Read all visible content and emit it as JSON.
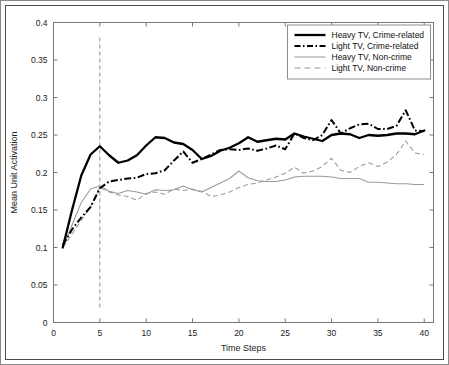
{
  "chart_data": {
    "type": "line",
    "title": "",
    "xlabel": "Time Steps",
    "ylabel": "Mean Unit Activation",
    "xlim": [
      0,
      41
    ],
    "ylim": [
      0,
      0.4
    ],
    "xticks": [
      0,
      5,
      10,
      15,
      20,
      25,
      30,
      35,
      40
    ],
    "xticklabels": [
      "0",
      "5",
      "10",
      "15",
      "20",
      "25",
      "30",
      "35",
      "40"
    ],
    "yticks": [
      0,
      0.05,
      0.1,
      0.15,
      0.2,
      0.25,
      0.3,
      0.35,
      0.4
    ],
    "yticklabels": [
      "0",
      "0.05",
      "0.1",
      "0.15",
      "0.2",
      "0.25",
      "0.3",
      "0.35",
      "0.4"
    ],
    "grid": false,
    "legend_position": "top-right",
    "annotations": [
      {
        "type": "vline",
        "x": 5,
        "y_from": 0.02,
        "y_to": 0.38,
        "style": "dashed",
        "color": "#8e8e8e"
      }
    ],
    "x": [
      1,
      2,
      3,
      4,
      5,
      6,
      7,
      8,
      9,
      10,
      11,
      12,
      13,
      14,
      15,
      16,
      17,
      18,
      19,
      20,
      21,
      22,
      23,
      24,
      25,
      26,
      27,
      28,
      29,
      30,
      31,
      32,
      33,
      34,
      35,
      36,
      37,
      38,
      39,
      40
    ],
    "series": [
      {
        "name": "Heavy TV, Crime-related",
        "color": "#000000",
        "style": "solid",
        "width": "thick",
        "values": [
          0.1,
          0.15,
          0.196,
          0.224,
          0.235,
          0.223,
          0.213,
          0.216,
          0.223,
          0.236,
          0.247,
          0.246,
          0.24,
          0.238,
          0.23,
          0.218,
          0.222,
          0.229,
          0.233,
          0.239,
          0.247,
          0.241,
          0.243,
          0.245,
          0.244,
          0.252,
          0.248,
          0.245,
          0.242,
          0.25,
          0.252,
          0.251,
          0.246,
          0.25,
          0.249,
          0.25,
          0.252,
          0.252,
          0.251,
          0.256
        ]
      },
      {
        "name": "Light TV, Crime-related",
        "color": "#000000",
        "style": "dash-dot",
        "width": "thick",
        "values": [
          0.103,
          0.124,
          0.14,
          0.154,
          0.179,
          0.188,
          0.19,
          0.192,
          0.193,
          0.198,
          0.199,
          0.203,
          0.216,
          0.228,
          0.213,
          0.218,
          0.224,
          0.23,
          0.231,
          0.23,
          0.232,
          0.229,
          0.232,
          0.236,
          0.231,
          0.252,
          0.246,
          0.243,
          0.25,
          0.27,
          0.252,
          0.259,
          0.264,
          0.265,
          0.258,
          0.258,
          0.262,
          0.283,
          0.256,
          0.255
        ]
      },
      {
        "name": "Heavy TV, Non-crime",
        "color": "#9a9a9a",
        "style": "solid",
        "width": "thin",
        "values": [
          0.1,
          0.13,
          0.16,
          0.178,
          0.182,
          0.175,
          0.172,
          0.176,
          0.174,
          0.171,
          0.177,
          0.176,
          0.177,
          0.182,
          0.177,
          0.174,
          0.18,
          0.186,
          0.192,
          0.202,
          0.193,
          0.189,
          0.188,
          0.188,
          0.19,
          0.194,
          0.195,
          0.195,
          0.195,
          0.194,
          0.192,
          0.192,
          0.192,
          0.187,
          0.187,
          0.186,
          0.185,
          0.185,
          0.184,
          0.184
        ]
      },
      {
        "name": "Light TV, Non-crime",
        "color": "#9a9a9a",
        "style": "dashed",
        "width": "thin",
        "values": [
          0.1,
          0.118,
          0.136,
          0.155,
          0.18,
          0.174,
          0.17,
          0.168,
          0.163,
          0.172,
          0.174,
          0.171,
          0.178,
          0.176,
          0.178,
          0.175,
          0.168,
          0.17,
          0.174,
          0.18,
          0.184,
          0.186,
          0.19,
          0.194,
          0.199,
          0.207,
          0.199,
          0.202,
          0.208,
          0.219,
          0.203,
          0.2,
          0.208,
          0.213,
          0.208,
          0.214,
          0.224,
          0.242,
          0.226,
          0.224
        ]
      }
    ]
  },
  "legend": {
    "items": [
      {
        "label": "Heavy TV, Crime-related",
        "style": "solid-thick"
      },
      {
        "label": "Light TV, Crime-related",
        "style": "dashdot-thick"
      },
      {
        "label": "Heavy TV, Non-crime",
        "style": "solid-thin"
      },
      {
        "label": "Light TV, Non-crime",
        "style": "dashed-thin"
      }
    ]
  }
}
